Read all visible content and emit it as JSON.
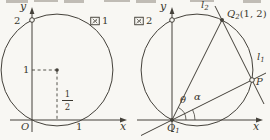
{
  "colors": {
    "background": "#f8f7f3",
    "ink": "#44413a",
    "text": "#3a372e"
  },
  "figure1": {
    "caption": {
      "glyph": "図",
      "number": "1",
      "full": "図1"
    },
    "axes": {
      "y_label": "y",
      "x_label": "x",
      "origin_label": "O"
    },
    "ticks": {
      "y_2": "2",
      "y_1": "1",
      "x_1": "1"
    },
    "center_x_fraction": {
      "numerator": "1",
      "denominator": "2"
    }
  },
  "figure2": {
    "caption": {
      "glyph": "図",
      "number": "2",
      "full": "図2"
    },
    "axes": {
      "y_label": "y",
      "x_label": "x"
    },
    "points": {
      "q1": {
        "base": "Q",
        "sub": "1"
      },
      "q2": {
        "base": "Q",
        "sub": "2",
        "coords": "(1, 2)"
      },
      "p": {
        "base": "P"
      }
    },
    "lines": {
      "l1": {
        "base": "l",
        "sub": "1"
      },
      "l2": {
        "base": "l",
        "sub": "2"
      }
    },
    "angles": {
      "theta": "θ",
      "alpha": "α"
    }
  }
}
